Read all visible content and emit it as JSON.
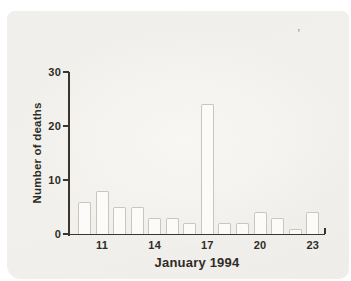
{
  "figure": {
    "ylabel": "Number of deaths",
    "xlabel": "January 1994",
    "artifact_mark": "’"
  },
  "colors": {
    "axis": "#3a362e",
    "text": "#2f2c26",
    "bar_fill": "#fcfbf9",
    "bar_border": "#c9c6c0",
    "panel_bg": "#f1efeb"
  },
  "chart_data": {
    "type": "bar",
    "x": [
      10,
      11,
      12,
      13,
      14,
      15,
      16,
      17,
      18,
      19,
      20,
      21,
      22,
      23
    ],
    "values": [
      6,
      8,
      5,
      5,
      3,
      3,
      2,
      24,
      2,
      2,
      4,
      3,
      1,
      4
    ],
    "title": "",
    "xlabel": "January 1994",
    "ylabel": "Number of deaths",
    "ylim": [
      0,
      30
    ],
    "y_ticks": [
      0,
      10,
      20,
      30
    ],
    "x_tick_labels": [
      11,
      14,
      17,
      20,
      23
    ],
    "grid": false,
    "legend": false
  }
}
